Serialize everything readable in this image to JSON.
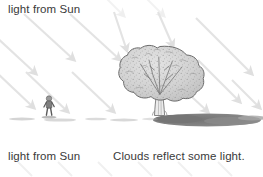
{
  "figure": {
    "type": "science-illustration",
    "background_color": "#ffffff",
    "width": 263,
    "height": 177
  },
  "captions": {
    "top": "light from Sun",
    "bottom_left": "light from Sun",
    "bottom_right": "Clouds reflect some light.",
    "text_color": "#3a3a3a"
  },
  "scene": {
    "ground": {
      "label": "ground-line",
      "y": 115,
      "color": "#6e6e6e"
    },
    "shadow": {
      "label": "tree-shadow",
      "color": "#7b7b7b",
      "description": "dark elongated shadow cast to the right of the tree"
    },
    "tree": {
      "label": "tree",
      "canopy_color": "#d2d2d2",
      "outline_color": "#6a6a6a",
      "trunk_color": "#e8e8e8",
      "center_x": 160,
      "canopy_top_y": 47,
      "base_y": 115
    },
    "person": {
      "label": "person",
      "color": "#555555",
      "x": 49,
      "base_y": 115,
      "height": 19
    },
    "light_rays": {
      "label": "sunlight-rays",
      "color": "#e2e2e2",
      "direction": "upper-left to lower-right",
      "angle_degrees": 41,
      "count": 14
    }
  }
}
